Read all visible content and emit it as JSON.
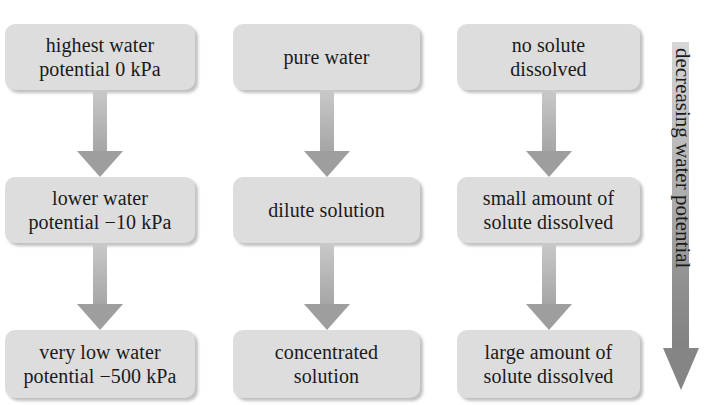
{
  "diagram": {
    "columns": [
      {
        "id": "water-potential",
        "nodes": [
          {
            "label": "highest water\npotential 0 kPa"
          },
          {
            "label": "lower water\npotential −10 kPa"
          },
          {
            "label": "very low water\npotential −500 kPa"
          }
        ]
      },
      {
        "id": "solution-type",
        "nodes": [
          {
            "label": "pure water"
          },
          {
            "label": "dilute solution"
          },
          {
            "label": "concentrated\nsolution"
          }
        ]
      },
      {
        "id": "solute-amount",
        "nodes": [
          {
            "label": "no solute\ndissolved"
          },
          {
            "label": "small amount of\nsolute dissolved"
          },
          {
            "label": "large amount of\nsolute dissolved"
          }
        ]
      }
    ],
    "gradient_arrow": {
      "label": "decreasing water potential",
      "direction": "down"
    },
    "colors": {
      "box_fill": "#dddddd",
      "arrow_light": "#d6d6d6",
      "arrow_dark": "#828282",
      "text": "#1a1a1a",
      "background": "#ffffff"
    }
  }
}
